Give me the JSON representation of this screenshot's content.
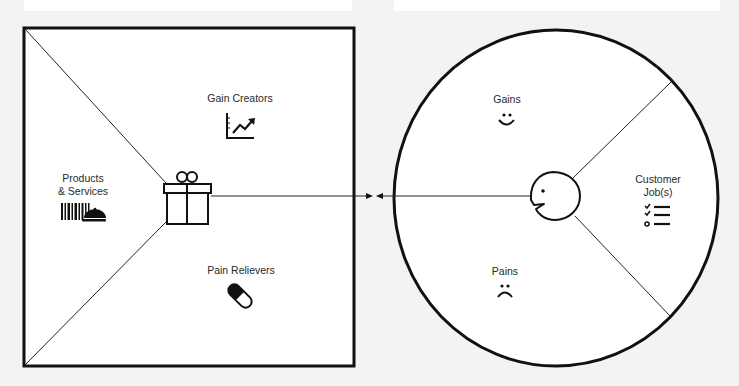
{
  "diagram": {
    "type": "value-proposition-canvas",
    "value_map": {
      "shape": "square",
      "center_icon": "gift-icon",
      "sections": [
        {
          "id": "gain-creators",
          "label": "Gain Creators",
          "icon": "rising-chart-icon"
        },
        {
          "id": "products-services",
          "label_line1": "Products",
          "label_line2": "& Services",
          "icon": "barcode-service-bell-icon"
        },
        {
          "id": "pain-relievers",
          "label": "Pain Relievers",
          "icon": "pill-capsule-icon"
        }
      ]
    },
    "customer_profile": {
      "shape": "circle",
      "center_icon": "customer-face-icon",
      "sections": [
        {
          "id": "gains",
          "label": "Gains",
          "icon": "smiley-face-icon"
        },
        {
          "id": "customer-jobs",
          "label_line1": "Customer",
          "label_line2": "Job(s)",
          "icon": "checklist-icon"
        },
        {
          "id": "pains",
          "label": "Pains",
          "icon": "frown-face-icon"
        }
      ]
    },
    "connection": {
      "type": "two-arrows-meeting",
      "description": "Arrows from value map and customer profile point toward each other"
    }
  },
  "colors": {
    "background": "#f3f3f3",
    "shape_fill": "#ffffff",
    "stroke": "#111111",
    "text": "#2a2a2a"
  }
}
